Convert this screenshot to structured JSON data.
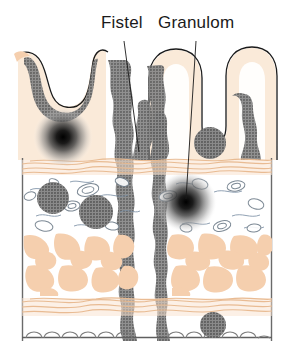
{
  "figure": {
    "kind": "histology-cross-section",
    "background_color": "#ffffff"
  },
  "labels": [
    {
      "id": "fistel",
      "text": "Fistel",
      "x": 101,
      "y": 13,
      "leader": {
        "x1": 124,
        "y1": 41,
        "x2": 139,
        "y2": 152
      }
    },
    {
      "id": "granulom",
      "text": "Granulom",
      "x": 158,
      "y": 13,
      "leader": {
        "x1": 196,
        "y1": 41,
        "x2": 186,
        "y2": 199
      }
    }
  ],
  "palette": {
    "tissue_peach": "#f5cfae",
    "tissue_peach_light": "#f7ddc6",
    "mucosa_cream": "#faead9",
    "infiltrate_gray": "#7d7d7d",
    "granuloma_gray": "#6f6f6f",
    "outline_black": "#1a1a1a",
    "vessel_blue": "#7f93a8",
    "border_gray": "#6a6a6a",
    "white": "#ffffff"
  },
  "layers": [
    {
      "name": "mucosa",
      "y_top": 44,
      "y_bottom": 160,
      "color": "#faead9"
    },
    {
      "name": "muscularis-mucosae",
      "y_top": 160,
      "y_bottom": 175,
      "color": "#f5cfae"
    },
    {
      "name": "submucosa",
      "y_top": 175,
      "y_bottom": 233,
      "color": "#ffffff"
    },
    {
      "name": "muscularis-propria",
      "y_top": 233,
      "y_bottom": 297,
      "color": "#f5cfae"
    },
    {
      "name": "subserosa-band",
      "y_top": 297,
      "y_bottom": 318,
      "color": "#f5cfae"
    },
    {
      "name": "serosa",
      "y_top": 318,
      "y_bottom": 341,
      "color": "#ffffff"
    }
  ],
  "frame": {
    "left_x": 22,
    "right_x": 272,
    "top_y": 158,
    "bottom_y": 341
  },
  "granulomas": [
    {
      "id": "aphthous-ulcer-left",
      "cx": 63,
      "cy": 137,
      "r": 26,
      "style": "radial-dark"
    },
    {
      "id": "granuloma-submucosa-1",
      "cx": 53,
      "cy": 198,
      "r": 16,
      "style": "solid"
    },
    {
      "id": "granuloma-submucosa-2",
      "cx": 96,
      "cy": 212,
      "r": 17,
      "style": "solid"
    },
    {
      "id": "granuloma-villus-right",
      "cx": 210,
      "cy": 143,
      "r": 16,
      "style": "solid"
    },
    {
      "id": "granuloma-labeled",
      "cx": 186,
      "cy": 202,
      "r": 27,
      "style": "radial-dark"
    },
    {
      "id": "granuloma-serosa",
      "cx": 213,
      "cy": 325,
      "r": 13,
      "style": "solid"
    }
  ],
  "fistula": {
    "id": "fistula-tract",
    "description": "transmural vertical channel between two irregular gray walls",
    "y_top": 60,
    "y_bottom": 341
  }
}
